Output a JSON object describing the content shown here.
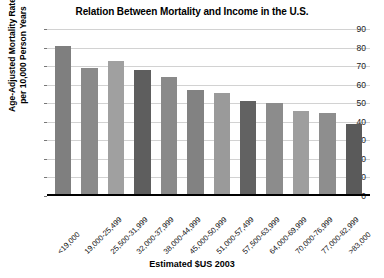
{
  "chart_data": {
    "type": "bar",
    "title": "Relation Between Mortality and Income in the U.S.",
    "xlabel": "Estimated $US 2003",
    "ylabel_line1": "Age-Adjusted Mortality Rate",
    "ylabel_line2": "per 10,000 Person Years",
    "categories": [
      "<19,000",
      "19,000-25,499",
      "25,500-31,999",
      "32,000-37,999",
      "38,000-44,999",
      "45,000-50,999",
      "51,000-57,499",
      "57,500-63,999",
      "64,000-69,999",
      "70,000-76,999",
      "77,000-82,999",
      ">83,000"
    ],
    "values": [
      81,
      69,
      73,
      68,
      64,
      57,
      55.5,
      51,
      50,
      46,
      44.5,
      39
    ],
    "bar_colors": [
      "#7f7f7f",
      "#8a8a8a",
      "#a0a0a0",
      "#5e5e5e",
      "#8a8a8a",
      "#828282",
      "#9a9a9a",
      "#626262",
      "#8c8c8c",
      "#9e9e9e",
      "#8e8e8e",
      "#5a5a5a"
    ],
    "ylim": [
      0,
      90
    ],
    "yticks": [
      0,
      10,
      20,
      30,
      40,
      50,
      60,
      70,
      80,
      90
    ],
    "ytick_labels": [
      "0",
      "10",
      "20",
      "30",
      "40",
      "50",
      "60",
      "70",
      "80",
      "90"
    ],
    "grid": true,
    "legend": null,
    "gridline_color": "#d2d2d2",
    "axis_color": "#000000"
  }
}
